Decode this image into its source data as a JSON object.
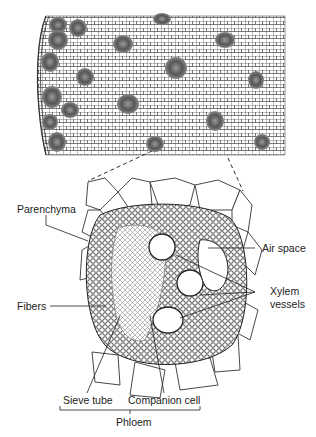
{
  "figure": {
    "labels": {
      "parenchyma": "Parenchyma",
      "air_space": "Air space",
      "xylem_line1": "Xylem",
      "xylem_line2": "vessels",
      "fibers": "Fibers",
      "sieve_tube": "Sieve tube",
      "companion_cell": "Companion cell",
      "phloem": "Phloem"
    },
    "colors": {
      "ink": "#222222",
      "background": "#ffffff",
      "bundle_fill": "#555555"
    }
  }
}
